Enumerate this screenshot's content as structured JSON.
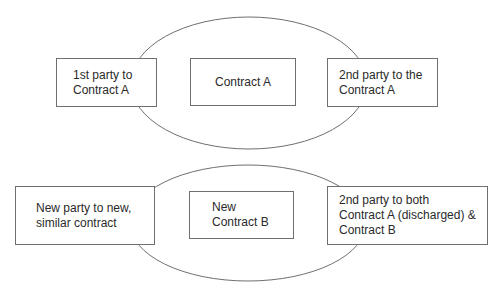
{
  "diagram": {
    "top_group": {
      "label": "Contract A relationship",
      "boxes": [
        {
          "id": "first-party-a",
          "text": "1st party to Contract A",
          "lines": [
            "1st party to",
            "Contract A"
          ]
        },
        {
          "id": "contract-a",
          "text": "Contract A",
          "lines": [
            "Contract A"
          ]
        },
        {
          "id": "second-party-a",
          "text": "2nd party to the Contract A",
          "lines": [
            "2nd party to the",
            "Contract A"
          ]
        }
      ]
    },
    "bottom_group": {
      "label": "Contract B relationship",
      "boxes": [
        {
          "id": "new-party",
          "text": "New party to new, similar contract",
          "lines": [
            "New party to new,",
            "similar contract"
          ]
        },
        {
          "id": "contract-b",
          "text": "New Contract B",
          "lines": [
            "New",
            "Contract B"
          ]
        },
        {
          "id": "second-party-both",
          "text": "2nd party to both Contract A (discharged) & Contract B",
          "lines": [
            "2nd party to both",
            "Contract A (discharged) &",
            "Contract B"
          ]
        }
      ]
    },
    "colors": {
      "stroke": "#6f6f6f",
      "text": "#2a2a2a",
      "background": "#ffffff"
    }
  }
}
